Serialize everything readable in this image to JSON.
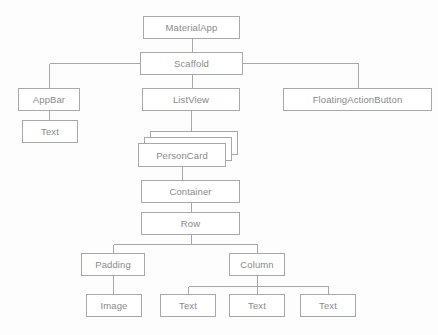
{
  "diagram": {
    "type": "tree",
    "background_color": "#fdfdfd",
    "border_color": "#a8a8a8",
    "text_color": "#8a8a8a",
    "nodes": [
      {
        "id": "materialapp",
        "label": "MaterialApp",
        "x": 143,
        "y": 16,
        "w": 97,
        "h": 23,
        "stacked": false
      },
      {
        "id": "scaffold",
        "label": "Scaffold",
        "x": 140,
        "y": 52,
        "w": 103,
        "h": 23,
        "stacked": false
      },
      {
        "id": "appbar",
        "label": "AppBar",
        "x": 18,
        "y": 88,
        "w": 62,
        "h": 23,
        "stacked": false
      },
      {
        "id": "appbartext",
        "label": "Text",
        "x": 22,
        "y": 120,
        "w": 56,
        "h": 23,
        "stacked": false
      },
      {
        "id": "listview",
        "label": "ListView",
        "x": 142,
        "y": 88,
        "w": 98,
        "h": 23,
        "stacked": false
      },
      {
        "id": "fab",
        "label": "FloatingActionButton",
        "x": 283,
        "y": 88,
        "w": 149,
        "h": 23,
        "stacked": false
      },
      {
        "id": "personcard",
        "label": "PersonCard",
        "x": 138,
        "y": 143,
        "w": 88,
        "h": 24,
        "stacked": true
      },
      {
        "id": "container",
        "label": "Container",
        "x": 141,
        "y": 180,
        "w": 99,
        "h": 23,
        "stacked": false
      },
      {
        "id": "row",
        "label": "Row",
        "x": 141,
        "y": 212,
        "w": 99,
        "h": 23,
        "stacked": false
      },
      {
        "id": "padding",
        "label": "Padding",
        "x": 81,
        "y": 253,
        "w": 64,
        "h": 23,
        "stacked": false
      },
      {
        "id": "image",
        "label": "Image",
        "x": 86,
        "y": 294,
        "w": 56,
        "h": 23,
        "stacked": false
      },
      {
        "id": "column",
        "label": "Column",
        "x": 229,
        "y": 253,
        "w": 56,
        "h": 23,
        "stacked": false
      },
      {
        "id": "text1",
        "label": "Text",
        "x": 160,
        "y": 294,
        "w": 56,
        "h": 23,
        "stacked": false
      },
      {
        "id": "text2",
        "label": "Text",
        "x": 229,
        "y": 294,
        "w": 56,
        "h": 23,
        "stacked": false
      },
      {
        "id": "text3",
        "label": "Text",
        "x": 300,
        "y": 294,
        "w": 56,
        "h": 23,
        "stacked": false
      }
    ],
    "edges": [
      {
        "from": "materialapp",
        "to": "scaffold",
        "kind": "vertical"
      },
      {
        "from": "scaffold",
        "to": "appbar",
        "kind": "elbow",
        "bus_y": 63
      },
      {
        "from": "scaffold",
        "to": "listview",
        "kind": "vertical"
      },
      {
        "from": "scaffold",
        "to": "fab",
        "kind": "elbow",
        "bus_y": 63
      },
      {
        "from": "appbar",
        "to": "appbartext",
        "kind": "vertical"
      },
      {
        "from": "listview",
        "to": "personcard",
        "kind": "vertical"
      },
      {
        "from": "personcard",
        "to": "container",
        "kind": "vertical"
      },
      {
        "from": "container",
        "to": "row",
        "kind": "vertical"
      },
      {
        "from": "row",
        "to": "padding",
        "kind": "elbow",
        "bus_y": 244
      },
      {
        "from": "row",
        "to": "column",
        "kind": "elbow",
        "bus_y": 244
      },
      {
        "from": "padding",
        "to": "image",
        "kind": "vertical"
      },
      {
        "from": "column",
        "to": "text1",
        "kind": "elbow",
        "bus_y": 286
      },
      {
        "from": "column",
        "to": "text2",
        "kind": "vertical"
      },
      {
        "from": "column",
        "to": "text3",
        "kind": "elbow",
        "bus_y": 286
      }
    ],
    "stack_offset": {
      "dx": 6,
      "dy": 6,
      "count": 2
    }
  }
}
